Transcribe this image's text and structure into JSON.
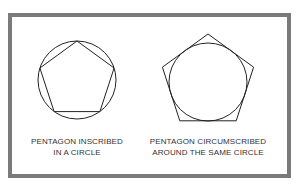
{
  "figures": [
    {
      "caption_line1": "PENTAGON INSCRIBED",
      "caption_line2": "IN A CIRCLE"
    },
    {
      "caption_line1": "PENTAGON CIRCUMSCRIBED",
      "caption_line2": "AROUND THE SAME CIRCLE"
    }
  ],
  "colors": {
    "frame": "#7a7a7a",
    "stroke": "#222222",
    "text": "#333333"
  }
}
